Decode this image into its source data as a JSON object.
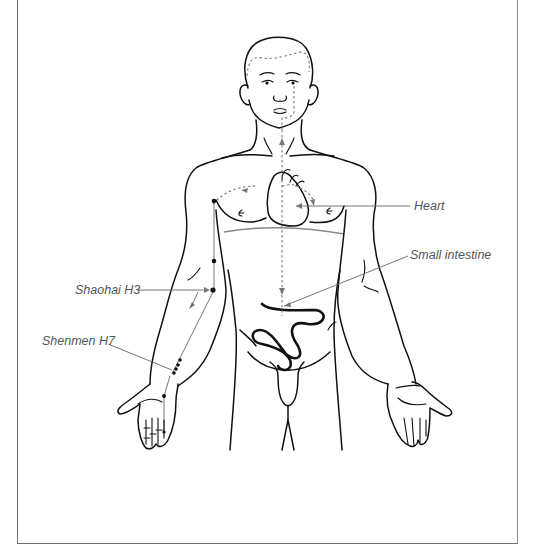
{
  "figure": {
    "labels": {
      "heart": "Heart",
      "small_intestine": "Small intestine",
      "shaohai": "Shaohai H3",
      "shenmen": "Shenmen H7"
    },
    "colors": {
      "outline": "#111111",
      "meridian_dashed": "#777777",
      "leader_line": "#666666",
      "label_text": "#555555",
      "frame": "#6e6e6e"
    }
  }
}
